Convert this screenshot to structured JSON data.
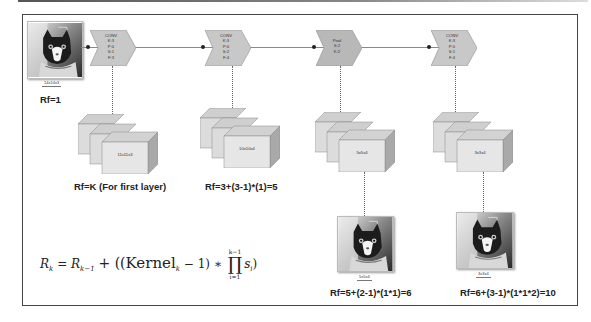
{
  "diagram": {
    "input": {
      "caption": "14x14x3",
      "rf_label": "Rf=1",
      "image_icon": "cat-photo"
    },
    "layers": [
      {
        "type": "CONV",
        "params": [
          "K:3",
          "P:0",
          "S:1",
          "F:3"
        ],
        "output_cube_label": "11x11x3",
        "rf_label": "Rf=K (For first layer)"
      },
      {
        "type": "CONV",
        "params": [
          "K:3",
          "P:0",
          "S:2",
          "F:4"
        ],
        "output_cube_label": "10x10x4",
        "rf_label": "Rf=3+(3-1)*(1)=5"
      },
      {
        "type": "Pool",
        "params": [
          "S:2",
          "K:2"
        ],
        "output_cube_label": "5x5x4",
        "output_image_caption": "5x5x4",
        "rf_label": "Rf=5+(2-1)*(1*1)=6"
      },
      {
        "type": "CONV",
        "params": [
          "K:3",
          "P:0",
          "S:1",
          "F:4"
        ],
        "output_cube_label": "3x3x4",
        "output_image_caption": "3x3x4",
        "rf_label": "Rf=6+(3-1)*(1*1*2)=10"
      }
    ],
    "formula": {
      "lhs": "R",
      "lhs_sub": "k",
      "eq": "=",
      "term1": "R",
      "term1_sub": "k−1",
      "plus": "+ ((",
      "kernel": "Kernel",
      "kernel_sub": "k",
      "minus": "− 1) ∗",
      "prod_symbol": "∏",
      "prod_upper": "k−1",
      "prod_lower": "i=1",
      "s": "s",
      "s_sub": "i",
      "close": ")"
    },
    "colors": {
      "chevron_fill": "#c8c8c8",
      "pool_fill": "#b8b8b8",
      "cube_front": "#e2e2e2",
      "cube_top": "#cfcfcf",
      "cube_side": "#a9a9a9",
      "frame": "#444444"
    }
  }
}
